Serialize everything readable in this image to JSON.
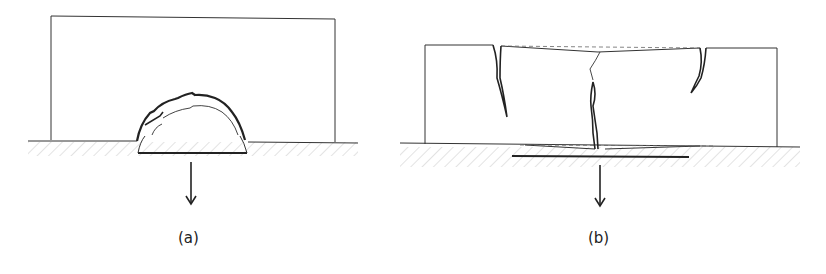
{
  "figure": {
    "panels": [
      {
        "id": "a",
        "label": "(a)",
        "description": "Block on ground with localized semicircular support zone pulled downward; arched crack pattern forms above support"
      },
      {
        "id": "b",
        "label": "(b)",
        "description": "Block on ground with wider support settlement; vertical cracks form at top edges and center, dashed lines show original outline"
      }
    ]
  }
}
